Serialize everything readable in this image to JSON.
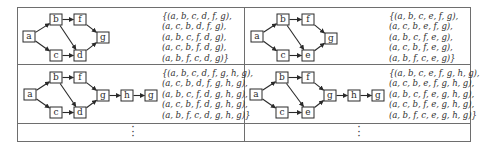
{
  "table": {
    "rows": [
      {
        "cells": [
          {
            "diagram": {
              "nodes": [
                {
                  "id": "a",
                  "label": "a",
                  "x": 23,
                  "y": 31
                },
                {
                  "id": "b",
                  "label": "b",
                  "x": 50,
                  "y": 14
                },
                {
                  "id": "f",
                  "label": "f",
                  "x": 74,
                  "y": 14
                },
                {
                  "id": "g",
                  "label": "g",
                  "x": 97,
                  "y": 32
                },
                {
                  "id": "c",
                  "label": "c",
                  "x": 50,
                  "y": 50
                },
                {
                  "id": "d",
                  "label": "d",
                  "x": 74,
                  "y": 50
                }
              ],
              "edges": [
                [
                  "a",
                  "b"
                ],
                [
                  "a",
                  "c"
                ],
                [
                  "b",
                  "f"
                ],
                [
                  "b",
                  "d"
                ],
                [
                  "c",
                  "d"
                ],
                [
                  "f",
                  "g"
                ],
                [
                  "d",
                  "g"
                ]
              ]
            },
            "paths": [
              "{(a, b, c, d, f, g),",
              "(a, c, b, d, f, g),",
              "(a, b, c, f, d, g),",
              "(a, c, b, f, d, g),",
              "(a, b, f, c, d, g)}"
            ]
          },
          {
            "diagram": {
              "nodes": [
                {
                  "id": "a",
                  "label": "a",
                  "x": 251,
                  "y": 31
                },
                {
                  "id": "b",
                  "label": "b",
                  "x": 277,
                  "y": 14
                },
                {
                  "id": "f",
                  "label": "f",
                  "x": 302,
                  "y": 14
                },
                {
                  "id": "g",
                  "label": "g",
                  "x": 325,
                  "y": 33
                },
                {
                  "id": "c",
                  "label": "c",
                  "x": 277,
                  "y": 50
                },
                {
                  "id": "e",
                  "label": "e",
                  "x": 302,
                  "y": 50
                }
              ],
              "edges": [
                [
                  "a",
                  "b"
                ],
                [
                  "a",
                  "c"
                ],
                [
                  "b",
                  "f"
                ],
                [
                  "b",
                  "e"
                ],
                [
                  "c",
                  "e"
                ],
                [
                  "f",
                  "g"
                ],
                [
                  "e",
                  "g"
                ]
              ]
            },
            "paths": [
              "{(a, b, c, e, f, g),",
              "(a, c, b, e, f, g),",
              "(a, b, c, f, e, g),",
              "(a, c, b, f, e, g),",
              "(a, b, f, c, e, g)}"
            ]
          }
        ]
      },
      {
        "cells": [
          {
            "diagram": {
              "nodes": [
                {
                  "id": "a",
                  "label": "a",
                  "x": 24,
                  "y": 89
                },
                {
                  "id": "b",
                  "label": "b",
                  "x": 50,
                  "y": 72
                },
                {
                  "id": "f",
                  "label": "f",
                  "x": 74,
                  "y": 72
                },
                {
                  "id": "g",
                  "label": "g",
                  "x": 97,
                  "y": 90
                },
                {
                  "id": "h",
                  "label": "h",
                  "x": 121,
                  "y": 90
                },
                {
                  "id": "g2",
                  "label": "g",
                  "x": 145,
                  "y": 90
                },
                {
                  "id": "c",
                  "label": "c",
                  "x": 50,
                  "y": 107
                },
                {
                  "id": "d",
                  "label": "d",
                  "x": 74,
                  "y": 107
                }
              ],
              "edges": [
                [
                  "a",
                  "b"
                ],
                [
                  "a",
                  "c"
                ],
                [
                  "b",
                  "f"
                ],
                [
                  "b",
                  "d"
                ],
                [
                  "c",
                  "d"
                ],
                [
                  "f",
                  "g"
                ],
                [
                  "d",
                  "g"
                ],
                [
                  "g",
                  "h"
                ],
                [
                  "h",
                  "g2"
                ]
              ]
            },
            "paths": [
              "{(a, b, c, d, f, g, h, g),",
              "(a, c, b, d, f, g, h, g),",
              "(a, b, c, f, d, g, h, g),",
              "(a, c, b, f, d, g, h, g),",
              "(a, b, f, c, d, g, h, g)}"
            ]
          },
          {
            "diagram": {
              "nodes": [
                {
                  "id": "a",
                  "label": "a",
                  "x": 250,
                  "y": 89
                },
                {
                  "id": "b",
                  "label": "b",
                  "x": 276,
                  "y": 72
                },
                {
                  "id": "f",
                  "label": "f",
                  "x": 302,
                  "y": 72
                },
                {
                  "id": "g",
                  "label": "g",
                  "x": 324,
                  "y": 90
                },
                {
                  "id": "h",
                  "label": "h",
                  "x": 348,
                  "y": 90
                },
                {
                  "id": "g2",
                  "label": "g",
                  "x": 372,
                  "y": 90
                },
                {
                  "id": "c",
                  "label": "c",
                  "x": 276,
                  "y": 107
                },
                {
                  "id": "e",
                  "label": "e",
                  "x": 302,
                  "y": 107
                }
              ],
              "edges": [
                [
                  "a",
                  "b"
                ],
                [
                  "a",
                  "c"
                ],
                [
                  "b",
                  "f"
                ],
                [
                  "b",
                  "e"
                ],
                [
                  "c",
                  "e"
                ],
                [
                  "f",
                  "g"
                ],
                [
                  "e",
                  "g"
                ],
                [
                  "g",
                  "h"
                ],
                [
                  "h",
                  "g2"
                ]
              ]
            },
            "paths": [
              "{(a, b, c, e, f, g, h, g),",
              "(a, c, b, e, f, g, h, g),",
              "(a, b, c, f, e, g, h, g),",
              "(a, c, b, f, e, g, h, g),",
              "(a, b, f, c, e, g, h, g)}"
            ]
          }
        ]
      },
      {
        "cells": [
          {
            "ellipsis": "⋮"
          },
          {
            "ellipsis": "⋮"
          }
        ]
      }
    ]
  },
  "style": {
    "border_color": "#6e6e6e",
    "node_border_color": "#2a2a2a",
    "arrow_color": "#2a2a2a"
  }
}
